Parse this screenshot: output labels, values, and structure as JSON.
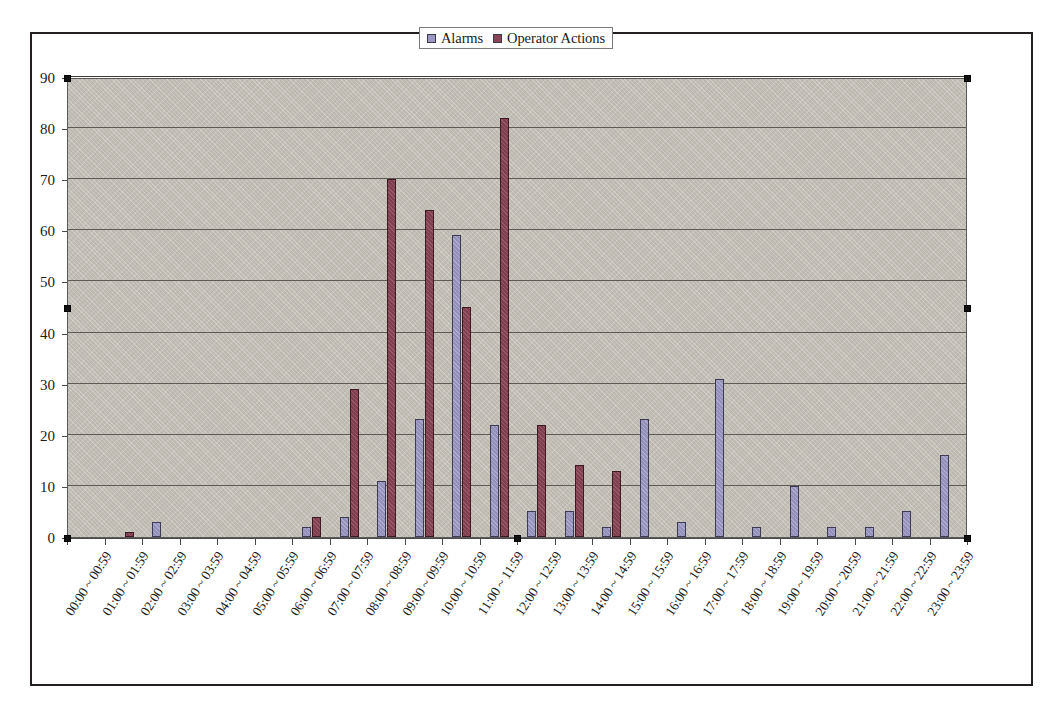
{
  "chart_data": {
    "type": "bar",
    "title": "",
    "xlabel": "",
    "ylabel": "",
    "ylim": [
      0,
      90
    ],
    "y_ticks": [
      0,
      10,
      20,
      30,
      40,
      50,
      60,
      70,
      80,
      90
    ],
    "grid": true,
    "legend_position": "top-center",
    "categories": [
      "00:00 ~ 00:59",
      "01:00 ~ 01:59",
      "02:00 ~ 02:59",
      "03:00 ~ 03:59",
      "04:00 ~ 04:59",
      "05:00 ~ 05:59",
      "06:00 ~ 06:59",
      "07:00 ~ 07:59",
      "08:00 ~ 08:59",
      "09:00 ~ 09:59",
      "10:00 ~ 10:59",
      "11:00 ~ 11:59",
      "12:00 ~ 12:59",
      "13:00 ~ 13:59",
      "14:00 ~ 14:59",
      "15:00 ~ 15:59",
      "16:00 ~ 16:59",
      "17:00 ~ 17:59",
      "18:00 ~ 18:59",
      "19:00 ~ 19:59",
      "20:00 ~ 20:59",
      "21:00 ~ 21:59",
      "22:00 ~ 22:59",
      "23:00 ~ 23:59"
    ],
    "series": [
      {
        "name": "Alarms",
        "color": "#9b98c4",
        "values": [
          0,
          0,
          3,
          0,
          0,
          0,
          2,
          4,
          11,
          23,
          59,
          22,
          5,
          5,
          2,
          23,
          3,
          31,
          2,
          10,
          2,
          2,
          5,
          16
        ]
      },
      {
        "name": "Operator Actions",
        "color": "#8b4456",
        "values": [
          0,
          1,
          0,
          0,
          0,
          0,
          4,
          29,
          70,
          64,
          45,
          82,
          22,
          14,
          13,
          0,
          0,
          0,
          0,
          0,
          0,
          0,
          0,
          0
        ]
      }
    ]
  },
  "legend": {
    "entries": [
      {
        "label": "Alarms",
        "color": "#9b98c4"
      },
      {
        "label": "Operator Actions",
        "color": "#8b4456"
      }
    ]
  },
  "selection": {
    "handles_visible": true,
    "handle_color": "#111111"
  }
}
